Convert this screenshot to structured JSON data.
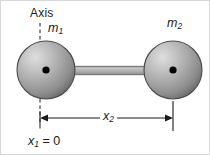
{
  "figure": {
    "type": "physics-diagram",
    "background_color": "#ffffff",
    "border_color": "#d8d8d8",
    "width": 210,
    "height": 155
  },
  "labels": {
    "axis": "Axis",
    "mass_left_symbol": "m",
    "mass_left_subscript": "1",
    "mass_right_symbol": "m",
    "mass_right_subscript": "2",
    "distance_symbol": "x",
    "distance_subscript": "2",
    "origin_symbol": "x",
    "origin_subscript": "1",
    "origin_equals": " = 0"
  },
  "geometry": {
    "sphere_left": {
      "cx": 45,
      "cy": 69,
      "r": 29,
      "center_dot_r": 3.6
    },
    "sphere_right": {
      "cx": 172,
      "cy": 69,
      "r": 29,
      "center_dot_r": 3.6
    },
    "rod": {
      "x1": 70,
      "x2": 147,
      "cy": 69,
      "half_height": 4
    },
    "axis_dashed_line": {
      "x": 39,
      "y_top": 22,
      "y_bottom": 130
    },
    "tick_right": {
      "x": 172,
      "y_top": 100,
      "y_bottom": 130
    },
    "dimension_line": {
      "x1": 39,
      "x2": 172,
      "y": 117
    }
  },
  "colors": {
    "sphere_light": "#d6d6d6",
    "sphere_mid": "#a8a8a8",
    "sphere_dark": "#6f6f6f",
    "sphere_outline": "#4a4a4a",
    "center_dot": "#000000",
    "rod_face": "#b4b4b4",
    "rod_edge": "#787878",
    "line": "#1a1a1a",
    "text": "#1a1a1a"
  }
}
